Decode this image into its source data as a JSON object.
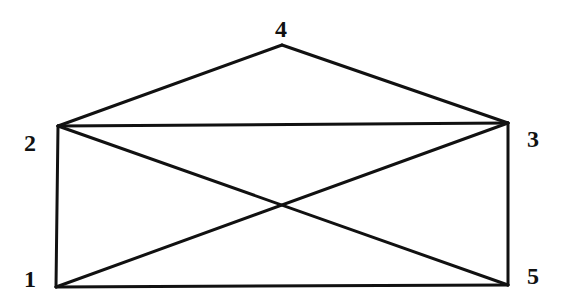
{
  "graph": {
    "vertices": [
      {
        "id": "1",
        "label": "1",
        "x": 56,
        "y": 287,
        "lx": 24,
        "ly": 287
      },
      {
        "id": "2",
        "label": "2",
        "x": 58,
        "y": 126,
        "lx": 24,
        "ly": 151
      },
      {
        "id": "3",
        "label": "3",
        "x": 508,
        "y": 123,
        "lx": 527,
        "ly": 147
      },
      {
        "id": "4",
        "label": "4",
        "x": 282,
        "y": 45,
        "lx": 275,
        "ly": 37
      },
      {
        "id": "5",
        "label": "5",
        "x": 508,
        "y": 285,
        "lx": 527,
        "ly": 284
      }
    ],
    "edges": [
      [
        "1",
        "2"
      ],
      [
        "2",
        "4"
      ],
      [
        "4",
        "3"
      ],
      [
        "2",
        "3"
      ],
      [
        "3",
        "5"
      ],
      [
        "1",
        "5"
      ],
      [
        "1",
        "3"
      ],
      [
        "2",
        "5"
      ]
    ],
    "edge_color": "#111111",
    "label_color": "#111111"
  }
}
